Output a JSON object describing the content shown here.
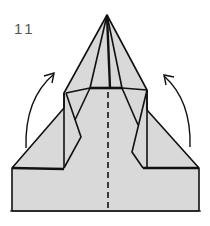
{
  "diagram": {
    "step_number": "11",
    "fill_color": "#d9d9d9",
    "line_color": "#111111",
    "arrows": [
      {
        "name": "left-fold-arrow",
        "direction": "up-right"
      },
      {
        "name": "right-fold-arrow",
        "direction": "up-left"
      }
    ],
    "center_line": "valley-fold-dashed"
  }
}
